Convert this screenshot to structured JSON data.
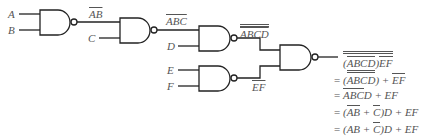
{
  "diagram": {
    "type": "logic-circuit",
    "gate_type": "NAND",
    "inputs": [
      "A",
      "B",
      "C",
      "D",
      "E",
      "F"
    ],
    "wire_labels": {
      "g1_out": "AB",
      "g2_out": "ABC",
      "g3_out": "ABCD",
      "g5_out": "EF"
    },
    "equations": [
      {
        "prefix": "",
        "expr": "(ABCD)EF"
      },
      {
        "prefix": "=",
        "expr": "(ABCD) + EF"
      },
      {
        "prefix": "=",
        "expr": "ABCD + EF"
      },
      {
        "prefix": "=",
        "expr": "(AB + C)D + EF"
      },
      {
        "prefix": "=",
        "expr": "(AB + C)D + EF"
      }
    ],
    "colors": {
      "line": "#222222",
      "text": "#555555",
      "background": "#ffffff"
    }
  }
}
